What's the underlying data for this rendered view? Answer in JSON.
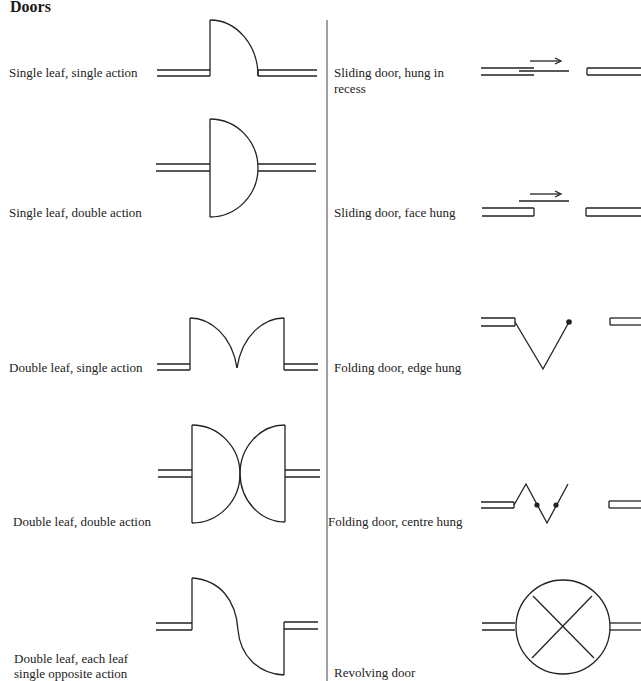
{
  "title": "Doors",
  "left_column": [
    {
      "label": "Single leaf, single action"
    },
    {
      "label": "Single leaf, double action"
    },
    {
      "label": "Double leaf, single action"
    },
    {
      "label": "Double leaf, double action"
    },
    {
      "label_line1": "Double leaf, each leaf",
      "label_line2": "single opposite action"
    }
  ],
  "right_column": [
    {
      "label_line1": "Sliding door, hung in",
      "label_line2": "recess"
    },
    {
      "label": "Sliding door, face hung"
    },
    {
      "label": "Folding door, edge hung"
    },
    {
      "label": "Folding door, centre hung"
    },
    {
      "label": "Revolving door"
    }
  ]
}
